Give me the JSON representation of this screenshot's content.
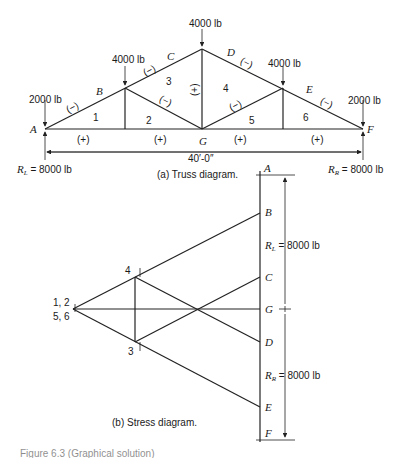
{
  "truss": {
    "loads": {
      "left_end": "2000 lb",
      "b_joint": "4000 lb",
      "apex": "4000 lb",
      "d_joint": "4000 lb",
      "right_end": "2000 lb"
    },
    "joint_labels": {
      "a": "A",
      "b": "B",
      "c": "C",
      "d": "D",
      "e": "E",
      "f": "F",
      "g": "G"
    },
    "panel_labels": [
      "1",
      "2",
      "3",
      "4",
      "5",
      "6"
    ],
    "member_signs": {
      "ab": "(−)",
      "bc": "(−)",
      "de": "(−)",
      "ef": "(−)",
      "diag_left": "(−)",
      "diag_right": "(−)",
      "vertical_center": "(+)",
      "bottom": [
        "(+)",
        "(+)",
        "(+)",
        "(+)"
      ]
    },
    "span": "40′-0″",
    "reaction_left": "R",
    "reaction_left_sub": "L",
    "reaction_left_value": " = 8000 lb",
    "reaction_right": "R",
    "reaction_right_sub": "R",
    "reaction_right_value": " = 8000 lb",
    "caption": "(a)  Truss diagram."
  },
  "stress": {
    "load_line_labels": {
      "a": "A",
      "b": "B",
      "c": "C",
      "g": "G",
      "d": "D",
      "e": "E",
      "f": "F"
    },
    "pole_label_top": "1, 2",
    "pole_label_bottom": "5, 6",
    "point_4": "4",
    "point_3": "3",
    "rl": "R",
    "rl_sub": "L",
    "rl_value": " = 8000 lb",
    "rr": "R",
    "rr_sub": "R",
    "rr_value": " = 8000 lb",
    "caption": "(b)  Stress diagram."
  },
  "figure_caption": "Figure 6.3 (Graphical solution)"
}
